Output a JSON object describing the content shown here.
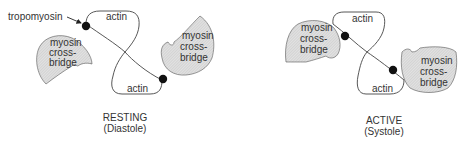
{
  "diagram": {
    "panels": [
      {
        "id": "resting",
        "title": "RESTING",
        "subtitle": "(Diastole)",
        "labels": {
          "tropomyosin": "tropomyosin",
          "actin_top": "actin",
          "actin_bottom": "actin",
          "myosin_left": [
            "myosin",
            "cross-",
            "bridge"
          ],
          "myosin_right": [
            "myosin",
            "cross-",
            "bridge"
          ]
        }
      },
      {
        "id": "active",
        "title": "ACTIVE",
        "subtitle": "(Systole)",
        "labels": {
          "actin_top": "actin",
          "actin_bottom": "actin",
          "myosin_left": [
            "myosin",
            "cross-",
            "bridge"
          ],
          "myosin_right": [
            "myosin",
            "cross-",
            "bridge"
          ]
        }
      }
    ],
    "colors": {
      "outline": "#444444",
      "hatch_fill": "#dcdcdc",
      "tropomyosin_dot": "#111111",
      "text": "#333333"
    }
  }
}
